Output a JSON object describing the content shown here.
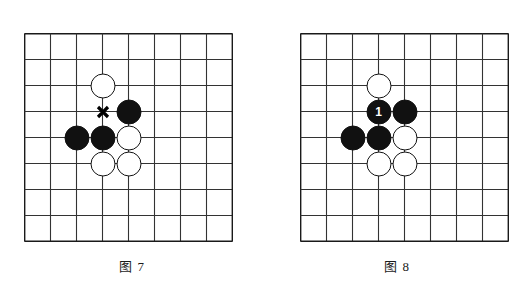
{
  "page": {
    "background_color": "#ffffff",
    "width": 529,
    "height": 290
  },
  "colors": {
    "grid_line": "#333333",
    "border_line": "#1a1a1a",
    "black_stone": "#111111",
    "white_stone": "#ffffff",
    "stone_outline": "#111111",
    "mark": "#000000"
  },
  "board": {
    "lines": 9,
    "cells": 8,
    "cell_size": 26
  },
  "figures": [
    {
      "id": "figure-7",
      "caption": "图 7",
      "stones": [
        {
          "color": "white",
          "col": 3,
          "row": 2,
          "label": ""
        },
        {
          "color": "black",
          "col": 4,
          "row": 3,
          "label": ""
        },
        {
          "color": "black",
          "col": 2,
          "row": 4,
          "label": ""
        },
        {
          "color": "black",
          "col": 3,
          "row": 4,
          "label": ""
        },
        {
          "color": "white",
          "col": 4,
          "row": 4,
          "label": ""
        },
        {
          "color": "white",
          "col": 3,
          "row": 5,
          "label": ""
        },
        {
          "color": "white",
          "col": 4,
          "row": 5,
          "label": ""
        }
      ],
      "marks": [
        {
          "type": "x-mark",
          "col": 3,
          "row": 3
        }
      ]
    },
    {
      "id": "figure-8",
      "caption": "图 8",
      "stones": [
        {
          "color": "white",
          "col": 3,
          "row": 2,
          "label": ""
        },
        {
          "color": "black",
          "col": 3,
          "row": 3,
          "label": "1"
        },
        {
          "color": "black",
          "col": 4,
          "row": 3,
          "label": ""
        },
        {
          "color": "black",
          "col": 2,
          "row": 4,
          "label": ""
        },
        {
          "color": "black",
          "col": 3,
          "row": 4,
          "label": ""
        },
        {
          "color": "white",
          "col": 4,
          "row": 4,
          "label": ""
        },
        {
          "color": "white",
          "col": 3,
          "row": 5,
          "label": ""
        },
        {
          "color": "white",
          "col": 4,
          "row": 5,
          "label": ""
        }
      ],
      "marks": []
    }
  ]
}
